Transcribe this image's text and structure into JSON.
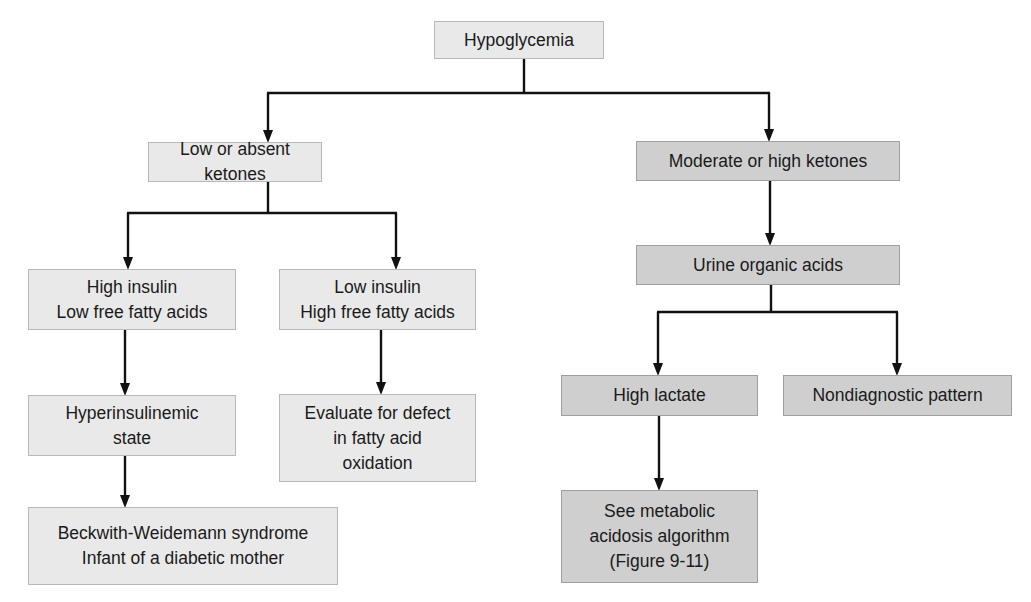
{
  "diagram": {
    "type": "flowchart",
    "colors": {
      "light_box": "#e9e9e9",
      "dark_box": "#cfcfcf",
      "line": "#111111"
    },
    "nodes": {
      "root": "Hypoglycemia",
      "low_ketones": "Low or absent ketones",
      "high_ketones": "Moderate or high ketones",
      "high_insulin": "High insulin\nLow free fatty acids",
      "low_insulin": "Low insulin\nHigh free fatty acids",
      "hyperinsulinemic": "Hyperinsulinemic\nstate",
      "evaluate_fao": "Evaluate for defect\nin fatty acid\noxidation",
      "beckwith": "Beckwith-Weidemann syndrome\nInfant of a diabetic mother",
      "urine_organic_acids": "Urine organic acids",
      "high_lactate": "High lactate",
      "nondiagnostic": "Nondiagnostic pattern",
      "metabolic_acidosis": "See metabolic\nacidosis algorithm\n(Figure 9-11)"
    },
    "edges": [
      [
        "root",
        "low_ketones"
      ],
      [
        "root",
        "high_ketones"
      ],
      [
        "low_ketones",
        "high_insulin"
      ],
      [
        "low_ketones",
        "low_insulin"
      ],
      [
        "high_insulin",
        "hyperinsulinemic"
      ],
      [
        "hyperinsulinemic",
        "beckwith"
      ],
      [
        "low_insulin",
        "evaluate_fao"
      ],
      [
        "high_ketones",
        "urine_organic_acids"
      ],
      [
        "urine_organic_acids",
        "high_lactate"
      ],
      [
        "urine_organic_acids",
        "nondiagnostic"
      ],
      [
        "high_lactate",
        "metabolic_acidosis"
      ]
    ]
  }
}
